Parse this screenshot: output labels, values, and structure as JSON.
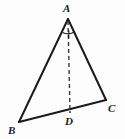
{
  "figure": {
    "background_color": "#fdfdfd",
    "stroke_color": "#1a1a1a",
    "labels": {
      "A": "A",
      "B": "B",
      "C": "C",
      "D": "D"
    },
    "points": {
      "A": {
        "x": 68,
        "y": 19
      },
      "B": {
        "x": 19,
        "y": 122
      },
      "C": {
        "x": 106,
        "y": 100
      },
      "D": {
        "x": 70,
        "y": 112
      }
    },
    "segments": [
      {
        "name": "AB",
        "from": "A",
        "to": "B",
        "style": "solid"
      },
      {
        "name": "AC",
        "from": "A",
        "to": "C",
        "style": "solid"
      },
      {
        "name": "BC",
        "from": "B",
        "to": "C",
        "style": "solid"
      },
      {
        "name": "AD",
        "from": "A",
        "to": "D",
        "style": "dashed"
      }
    ],
    "angle_marks": [
      {
        "name": "angle-bisector-mark-A",
        "at": "A",
        "type": "arc-with-tick"
      }
    ]
  }
}
